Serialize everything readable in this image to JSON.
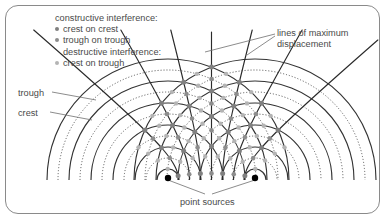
{
  "diagram": {
    "labels": {
      "legend_heading_constructive": "constructive interference:",
      "legend_item_crest_on_crest": "crest on crest",
      "legend_item_trough_on_trough": "trough on trough",
      "legend_heading_destructive": "destructive interference:",
      "legend_item_crest_on_trough": "crest on trough",
      "lines_max_displacement_line1": "lines of maximum",
      "lines_max_displacement_line2": "displacement",
      "trough": "trough",
      "crest": "crest",
      "point_sources": "point sources"
    },
    "colors": {
      "border": "#8a8a8a",
      "text": "#4a4a4a",
      "crest_arc": "#333333",
      "trough_arc": "#555555",
      "max_line": "#2b2b2b",
      "leader": "#6f6f6f",
      "source_dot": "#000000",
      "dot_constructive_crest": "#808080",
      "dot_constructive_trough": "#8d8d8d",
      "dot_destructive": "#b4b4b4"
    },
    "bullet_colors": [
      "#808080",
      "#8d8d8d",
      "#b4b4b4"
    ]
  },
  "chart_data": {
    "type": "diagram",
    "sources": [
      {
        "name": "left point source",
        "x": 168,
        "y": 178
      },
      {
        "name": "right point source",
        "x": 255,
        "y": 178
      }
    ],
    "baseline_y": 180,
    "wavelength_px": 22,
    "arc_spacing_px": 11,
    "arc_count_per_source": 11,
    "arc_types_alternating": [
      "crest",
      "trough"
    ],
    "crest_style": "solid",
    "trough_style": "dotted",
    "lines_of_maximum_displacement_count": 7,
    "annotations": [
      "constructive interference: crest on crest",
      "constructive interference: trough on trough",
      "destructive interference: crest on trough",
      "lines of maximum displacement",
      "trough",
      "crest",
      "point sources"
    ]
  }
}
